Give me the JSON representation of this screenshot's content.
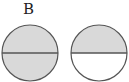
{
  "label": "B",
  "colors": {
    "shade": "#d9d9d9",
    "stroke": "#555555",
    "empty": "#ffffff"
  },
  "circles": [
    {
      "id": "left",
      "top_half": "shaded",
      "bottom_half": "shaded"
    },
    {
      "id": "right",
      "top_half": "shaded",
      "bottom_half": "empty"
    }
  ]
}
